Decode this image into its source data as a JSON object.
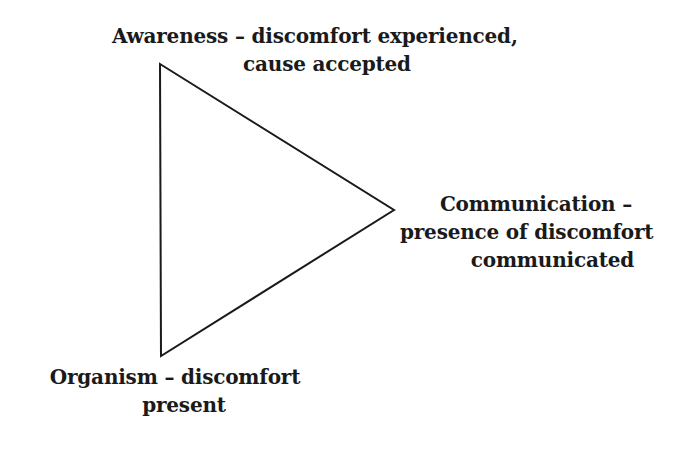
{
  "diagram": {
    "type": "triangle",
    "vertices": {
      "awareness": {
        "line1": "Awareness – discomfort experienced,",
        "line2": "cause accepted"
      },
      "communication": {
        "line1": "Communication –",
        "line2": "presence of discomfort",
        "line3": "communicated"
      },
      "organism": {
        "line1": "Organism – discomfort",
        "line2": "present"
      }
    },
    "stroke_color": "#1a1a1a",
    "background": "#ffffff"
  }
}
